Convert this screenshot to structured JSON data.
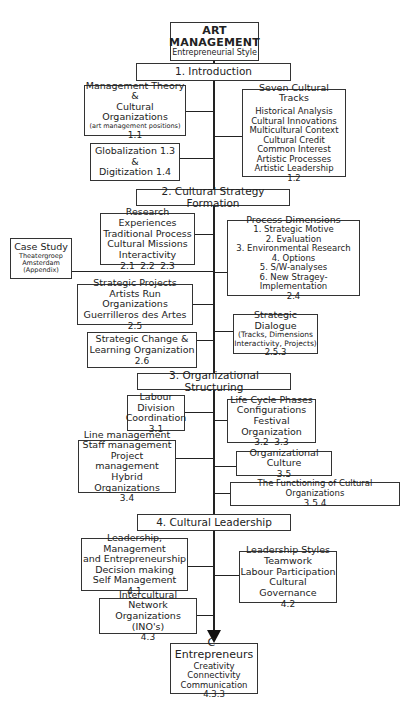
{
  "title": {
    "line1": "ART",
    "line2": "MANAGEMENT",
    "subtitle": "Entrepreneurial Style"
  },
  "sections": [
    {
      "label": "1. Introduction"
    },
    {
      "label": "2. Cultural Strategy Formation"
    },
    {
      "label": "3. Organizational Structuring"
    },
    {
      "label": "4. Cultural Leadership"
    }
  ],
  "intro": {
    "mgmt_theory": {
      "lines": [
        "Management Theory",
        "&",
        "Cultural Organizations"
      ],
      "note": "(art management positions)",
      "num": "1.1"
    },
    "globalization": {
      "lines": [
        "Globalization 1.3",
        "&",
        "Digitization 1.4"
      ]
    },
    "seven_tracks": {
      "heading": "Seven Cultural Tracks",
      "items": [
        "Historical Analysis",
        "Cultural Innovations",
        "Multicultural Context",
        "Cultural Credit",
        "Common Interest",
        "Artistic Processes",
        "Artistic Leadership"
      ],
      "num": "1.2"
    }
  },
  "strategy": {
    "research": {
      "lines": [
        "Research Experiences",
        "Traditional Process",
        "Cultural Missions",
        "Interactivity"
      ],
      "num": "2.1  2.2  2.3"
    },
    "case_study": {
      "heading": "Case Study",
      "lines": [
        "Theatergroep",
        "Amsterdam",
        "(Appendix)"
      ]
    },
    "process_dimensions": {
      "heading": "Process Dimensions",
      "items": [
        "1. Strategic Motive",
        "2. Evaluation",
        "3. Environmental Research",
        "4. Options",
        "5. S/W-analyses",
        "6. New Stragey-Implementation"
      ],
      "num": "2.4"
    },
    "strategic_projects": {
      "lines": [
        "Strategic Projects",
        "Artists Run Organizations",
        "Guerrilleros des Artes"
      ],
      "num": "2.5"
    },
    "strategic_dialogue": {
      "heading": "Strategic Dialogue",
      "lines": [
        "(Tracks, Dimensions",
        "Interactivity, Projects)"
      ],
      "num": "2.5.3"
    },
    "strategic_change": {
      "lines": [
        "Strategic Change &",
        "Learning Organization"
      ],
      "num": "2.6"
    }
  },
  "structuring": {
    "labour": {
      "lines": [
        "Labour Division",
        "Coordination"
      ],
      "num": "3.1"
    },
    "life_cycle": {
      "lines": [
        "Life Cycle Phases",
        "Configurations",
        "Festival Organization"
      ],
      "num": "3.2  3.3"
    },
    "line_mgmt": {
      "lines": [
        "Line management",
        "Staff management",
        "Project management",
        "Hybrid Organizations"
      ],
      "num": "3.4"
    },
    "org_culture": {
      "lines": [
        "Organizational Culture"
      ],
      "num": "3.5"
    },
    "functioning": {
      "lines": [
        "The Functioning of Cultural Organizations"
      ],
      "num": "3.5.4"
    }
  },
  "leadership": {
    "lme": {
      "lines": [
        "Leadership, Management",
        "and Entrepreneurship",
        "Decision making",
        "Self Management"
      ],
      "num": "4.1"
    },
    "styles": {
      "lines": [
        "Leadership Styles",
        "Teamwork",
        "Labour Participation",
        "Cultural Governance"
      ],
      "num": "4.2"
    },
    "ino": {
      "lines": [
        "Intercultural Network",
        "Organizations (INO's)"
      ],
      "num": "4.3"
    }
  },
  "outcome": {
    "heading": "C–Entrepreneurs",
    "lines": [
      "Creativity",
      "Connectivity",
      "Communication"
    ],
    "num": "4.3.3"
  }
}
